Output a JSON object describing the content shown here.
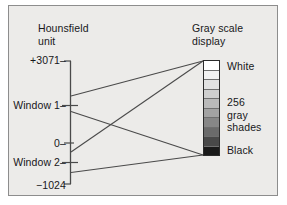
{
  "figure": {
    "title_left": "Hounsfield\nunit",
    "title_right": "Gray scale\ndisplay"
  },
  "axis": {
    "ticks": [
      {
        "name": "max",
        "label": "+3071–"
      },
      {
        "name": "window1",
        "label": "Window 1–"
      },
      {
        "name": "zero",
        "label": "0–"
      },
      {
        "name": "window2",
        "label": "Window 2–"
      },
      {
        "name": "min",
        "label": "−1024"
      }
    ]
  },
  "grayscale": {
    "top_label": "White",
    "middle_label": "256\ngray\nshades",
    "bottom_label": "Black",
    "band_count": 10,
    "bands": [
      "#ffffff",
      "#f2f2f2",
      "#e2e2e2",
      "#cfcfcf",
      "#bababa",
      "#a3a3a3",
      "#878787",
      "#6b6b6b",
      "#494949",
      "#1a1a1a"
    ]
  },
  "colors": {
    "plate_bg": "#ecebe9",
    "plate_border": "#8d8d8d",
    "ink": "#17171a",
    "line": "#4a4a4a",
    "bar_border": "#2b2b2b"
  },
  "chart_data": {
    "type": "diagram",
    "xlabel": "",
    "ylabel": "Hounsfield unit",
    "ylim": [
      -1024,
      3071
    ],
    "ytick_values": [
      3071,
      0,
      -1024
    ],
    "ytick_labels": [
      "+3071",
      "0",
      "−1024"
    ],
    "annotations": [
      {
        "name": "window-1",
        "label": "Window 1",
        "maps_to": [
          "White",
          "Black"
        ]
      },
      {
        "name": "window-2",
        "label": "Window 2",
        "maps_to": [
          "White",
          "Black"
        ]
      }
    ],
    "legend": [
      "White",
      "256 gray shades",
      "Black"
    ],
    "grid": false
  }
}
